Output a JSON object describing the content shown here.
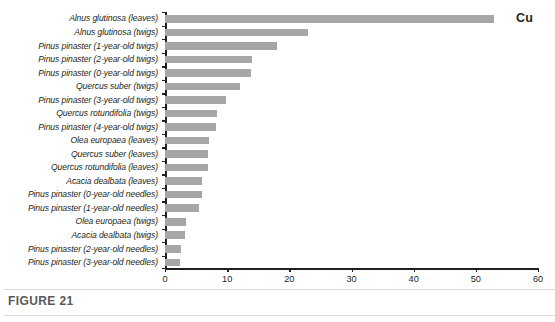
{
  "figure": {
    "caption": "FIGURE 21",
    "series_annotation": "Cu"
  },
  "chart_data": {
    "type": "bar",
    "orientation": "horizontal",
    "title": "",
    "subtitle": "",
    "xlabel": "",
    "ylabel": "",
    "xlim": [
      0,
      60
    ],
    "xticks": [
      0,
      10,
      20,
      30,
      40,
      50,
      60
    ],
    "grid": false,
    "legend": [
      "Cu"
    ],
    "legend_position": "top-right",
    "bar_color": "#a6a6a6",
    "categories": [
      "Alnus glutinosa (leaves)",
      "Alnus glutinosa (twigs)",
      "Pinus pinaster (1-year-old twigs)",
      "Pinus pinaster (2-year-old twigs)",
      "Pinus pinaster (0-year-old twigs)",
      "Quercus suber (twigs)",
      "Pinus pinaster (3-year-old twigs)",
      "Quercus rotundifolia (twigs)",
      "Pinus pinaster (4-year-old twigs)",
      "Olea europaea (leaves)",
      "Quercus suber (leaves)",
      "Quercus rotundifolia (leaves)",
      "Acacia dealbata (leaves)",
      "Pinus pinaster (0-year-old needles)",
      "Pinus pinaster (1-year-old needles)",
      "Olea europaea (twigs)",
      "Acacia dealbata (twigs)",
      "Pinus pinaster (2-year-old needles)",
      "Pinus pinaster (3-year-old needles)"
    ],
    "values": [
      53,
      23,
      18,
      14,
      13.8,
      12.1,
      9.8,
      8.4,
      8.2,
      7.0,
      6.9,
      6.9,
      6.0,
      5.9,
      5.4,
      3.4,
      3.2,
      2.5,
      2.4
    ]
  }
}
